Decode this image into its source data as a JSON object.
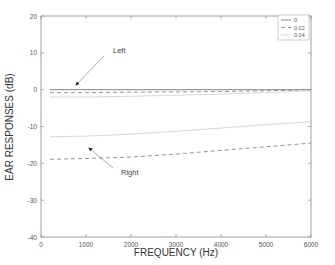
{
  "chart_data": {
    "type": "line",
    "title": "",
    "xlabel": "FREQUENCY (Hz)",
    "ylabel": "EAR RESPONSES (dB)",
    "xlim": [
      0,
      6000
    ],
    "ylim": [
      -40,
      20
    ],
    "xticks": [
      0,
      1000,
      2000,
      3000,
      4000,
      5000,
      6000
    ],
    "yticks": [
      20,
      10,
      0,
      -10,
      -20,
      -30,
      -40
    ],
    "grid": false,
    "legend_position": "upper right",
    "legend": [
      {
        "label": "0",
        "style": "solid"
      },
      {
        "label": "0.02",
        "style": "dashed"
      },
      {
        "label": "0.04",
        "style": "dotted"
      }
    ],
    "x": [
      200,
      1000,
      2000,
      3000,
      4000,
      5000,
      6000
    ],
    "series": [
      {
        "name": "0",
        "ear": "Left",
        "style": "solid",
        "values": [
          0,
          0,
          0,
          0,
          0,
          0,
          0
        ]
      },
      {
        "name": "0.02",
        "ear": "Left",
        "style": "dashed",
        "values": [
          -0.8,
          -0.8,
          -0.7,
          -0.6,
          -0.5,
          -0.3,
          0
        ]
      },
      {
        "name": "0.04",
        "ear": "Left",
        "style": "dotted",
        "values": [
          -2.0,
          -2.0,
          -1.8,
          -1.5,
          -1.2,
          -0.8,
          -0.3
        ]
      },
      {
        "name": "0.02",
        "ear": "Right",
        "style": "dashed",
        "values": [
          -18.9,
          -18.7,
          -18.3,
          -17.5,
          -16.5,
          -15.5,
          -14.5
        ]
      },
      {
        "name": "0.04",
        "ear": "Right",
        "style": "dotted",
        "values": [
          -12.8,
          -12.6,
          -12.1,
          -11.3,
          -10.4,
          -9.5,
          -8.7
        ]
      }
    ],
    "annotations": [
      {
        "text": "Left",
        "arrow_to": [
          800,
          0
        ]
      },
      {
        "text": "Right",
        "arrow_to": [
          1100,
          -15.5
        ]
      }
    ]
  }
}
